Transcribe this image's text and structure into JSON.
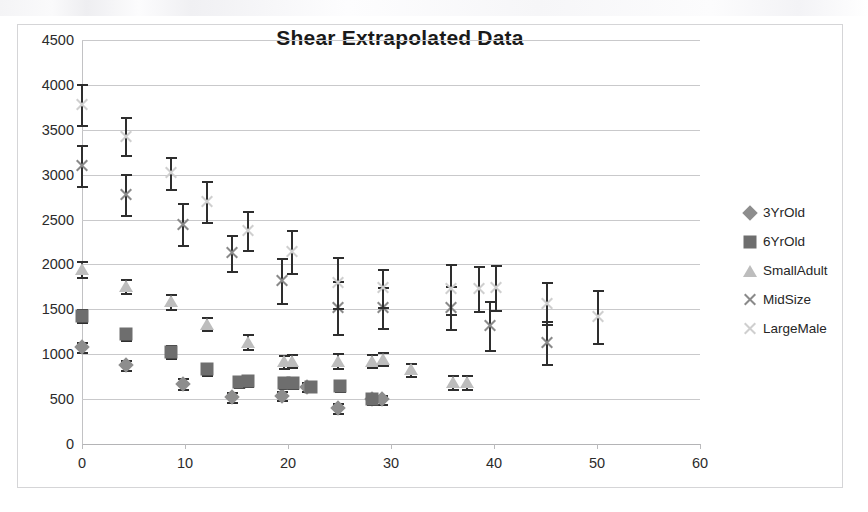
{
  "chart_data": {
    "type": "scatter",
    "title": "Shear Extrapolated Data",
    "xlabel": "",
    "ylabel": "",
    "xlim": [
      0,
      60
    ],
    "ylim": [
      0,
      4500
    ],
    "x_ticks": [
      0,
      10,
      20,
      30,
      40,
      50,
      60
    ],
    "y_ticks": [
      0,
      500,
      1000,
      1500,
      2000,
      2500,
      3000,
      3500,
      4000,
      4500
    ],
    "grid": "horizontal",
    "legend_position": "right",
    "error_bars": true,
    "series": [
      {
        "name": "3YrOld",
        "marker": "diamond",
        "color": "#8d8d8d",
        "points": [
          {
            "x": 0.0,
            "y": 1080,
            "err": 60
          },
          {
            "x": 4.3,
            "y": 880,
            "err": 55
          },
          {
            "x": 9.8,
            "y": 670,
            "err": 60
          },
          {
            "x": 14.6,
            "y": 520,
            "err": 55
          },
          {
            "x": 19.4,
            "y": 540,
            "err": 50
          },
          {
            "x": 21.8,
            "y": 640,
            "err": 55
          },
          {
            "x": 24.9,
            "y": 400,
            "err": 60
          },
          {
            "x": 28.2,
            "y": 500,
            "err": 50
          },
          {
            "x": 29.1,
            "y": 500,
            "err": 50
          }
        ]
      },
      {
        "name": "6YrOld",
        "marker": "square",
        "color": "#6e6e6e",
        "points": [
          {
            "x": 0.0,
            "y": 1430,
            "err": 70
          },
          {
            "x": 4.3,
            "y": 1220,
            "err": 60
          },
          {
            "x": 8.6,
            "y": 1030,
            "err": 70
          },
          {
            "x": 12.1,
            "y": 830,
            "err": 65
          },
          {
            "x": 15.2,
            "y": 690,
            "err": 55
          },
          {
            "x": 16.1,
            "y": 700,
            "err": 55
          },
          {
            "x": 19.6,
            "y": 680,
            "err": 60
          },
          {
            "x": 20.5,
            "y": 680,
            "err": 60
          },
          {
            "x": 22.2,
            "y": 640,
            "err": 55
          },
          {
            "x": 25.0,
            "y": 650,
            "err": 55
          },
          {
            "x": 28.2,
            "y": 500,
            "err": 55
          }
        ]
      },
      {
        "name": "SmallAdult",
        "marker": "triangle",
        "color": "#bdbdbd",
        "points": [
          {
            "x": 0.0,
            "y": 1950,
            "err": 90
          },
          {
            "x": 4.3,
            "y": 1760,
            "err": 75
          },
          {
            "x": 8.6,
            "y": 1590,
            "err": 85
          },
          {
            "x": 12.1,
            "y": 1340,
            "err": 75
          },
          {
            "x": 16.1,
            "y": 1140,
            "err": 85
          },
          {
            "x": 19.6,
            "y": 920,
            "err": 70
          },
          {
            "x": 20.4,
            "y": 930,
            "err": 70
          },
          {
            "x": 24.9,
            "y": 930,
            "err": 80
          },
          {
            "x": 28.2,
            "y": 930,
            "err": 70
          },
          {
            "x": 29.2,
            "y": 950,
            "err": 70
          },
          {
            "x": 31.9,
            "y": 830,
            "err": 70
          },
          {
            "x": 36.0,
            "y": 690,
            "err": 80
          },
          {
            "x": 37.4,
            "y": 690,
            "err": 80
          }
        ]
      },
      {
        "name": "MidSize",
        "marker": "x",
        "color": "#8a8a8a",
        "points": [
          {
            "x": 0.0,
            "y": 3100,
            "err": 230
          },
          {
            "x": 4.3,
            "y": 2780,
            "err": 225
          },
          {
            "x": 9.8,
            "y": 2450,
            "err": 230
          },
          {
            "x": 14.6,
            "y": 2130,
            "err": 200
          },
          {
            "x": 19.4,
            "y": 1820,
            "err": 250
          },
          {
            "x": 24.9,
            "y": 1520,
            "err": 300
          },
          {
            "x": 29.2,
            "y": 1520,
            "err": 230
          },
          {
            "x": 35.8,
            "y": 1520,
            "err": 240
          },
          {
            "x": 39.6,
            "y": 1320,
            "err": 270
          },
          {
            "x": 45.1,
            "y": 1130,
            "err": 240
          }
        ]
      },
      {
        "name": "LargeMale",
        "marker": "x-light",
        "color": "#cfcfcf",
        "points": [
          {
            "x": 0.0,
            "y": 3780,
            "err": 230
          },
          {
            "x": 4.3,
            "y": 3430,
            "err": 210
          },
          {
            "x": 8.6,
            "y": 3020,
            "err": 180
          },
          {
            "x": 12.1,
            "y": 2700,
            "err": 230
          },
          {
            "x": 16.1,
            "y": 2380,
            "err": 220
          },
          {
            "x": 20.4,
            "y": 2140,
            "err": 240
          },
          {
            "x": 24.9,
            "y": 1800,
            "err": 280
          },
          {
            "x": 29.2,
            "y": 1740,
            "err": 210
          },
          {
            "x": 35.8,
            "y": 1730,
            "err": 280
          },
          {
            "x": 38.5,
            "y": 1730,
            "err": 250
          },
          {
            "x": 40.2,
            "y": 1740,
            "err": 250
          },
          {
            "x": 45.1,
            "y": 1570,
            "err": 230
          },
          {
            "x": 50.1,
            "y": 1420,
            "err": 290
          }
        ]
      }
    ]
  },
  "legend": {
    "items": [
      {
        "label": "3YrOld",
        "marker": "diamond"
      },
      {
        "label": "6YrOld",
        "marker": "square"
      },
      {
        "label": "SmallAdult",
        "marker": "triangle"
      },
      {
        "label": "MidSize",
        "marker": "x"
      },
      {
        "label": "LargeMale",
        "marker": "x-light"
      }
    ]
  }
}
